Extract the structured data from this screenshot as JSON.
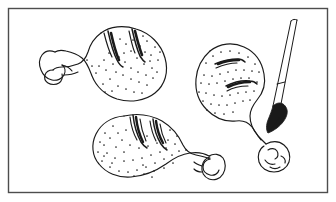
{
  "image": {
    "title": "Basting chicken drumsticks",
    "medium": "pen-and-ink line drawing",
    "palette": {
      "background": "#ffffff",
      "ink": "#1a1a1a",
      "frame": "#4d4d4d",
      "stipple": "#222222"
    },
    "frame": {
      "name": "illustration-border",
      "x": 8,
      "y": 8,
      "width": 320,
      "height": 185,
      "stroke_width": 1.4
    },
    "subjects": [
      {
        "id": "drumstick-top-left",
        "label": "Chicken drumstick, upper left",
        "orientation": "meat end right, bone knob left, tilted",
        "score_marks": 2,
        "stipple_dots": 46
      },
      {
        "id": "drumstick-right",
        "label": "Chicken drumstick, right",
        "orientation": "meat end upper left, bone knob lower right",
        "score_marks": 2,
        "stipple_dots": 42
      },
      {
        "id": "drumstick-bottom",
        "label": "Chicken drumstick, bottom center",
        "orientation": "meat end left, bone knob right",
        "score_marks": 2,
        "stipple_dots": 48
      },
      {
        "id": "basting-brush",
        "label": "Basting brush",
        "orientation": "angled from upper right down to lower left",
        "tip": "inked dark bristle tip touching bone knob"
      }
    ]
  }
}
